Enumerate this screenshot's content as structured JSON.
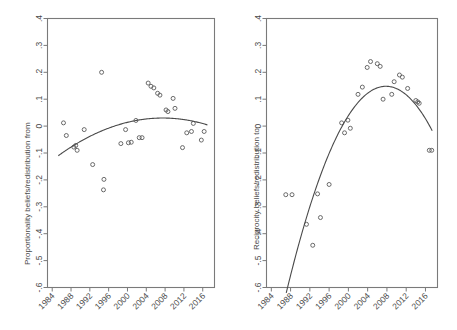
{
  "figure": {
    "type": "multi-panel-scatter",
    "panels": 2,
    "background": "#ffffff",
    "point_color": "#5a5a5a",
    "line_color": "#4a4a4a",
    "axis_color": "#7a7a7a"
  },
  "chart_data": [
    {
      "type": "scatter",
      "panel": "left",
      "title": "",
      "xlabel": "",
      "ylabel": "Proportionality beliefs/redistribution from",
      "xlim": [
        1983,
        2018.5
      ],
      "ylim": [
        -0.6,
        0.4
      ],
      "grid": false,
      "legend": "none",
      "xticks": [
        1984,
        1988,
        1992,
        1996,
        2000,
        2004,
        2008,
        2012,
        2016
      ],
      "xticklabels": [
        "1984",
        "1988",
        "1992",
        "1996",
        "2000",
        "2004",
        "2008",
        "2012",
        "2016"
      ],
      "yticks": [
        0.4,
        0.3,
        0.2,
        0.1,
        0,
        -0.1,
        -0.2,
        -0.3,
        -0.4,
        -0.5,
        -0.6
      ],
      "yticklabels": [
        ".4",
        ".3",
        ".2",
        ".1",
        "0",
        "-.1",
        "-.2",
        "-.3",
        "-.4",
        "-.5",
        "-.6"
      ],
      "points": [
        {
          "x": 1986.4,
          "y": 0.012
        },
        {
          "x": 1987.0,
          "y": -0.035
        },
        {
          "x": 1988.6,
          "y": -0.078
        },
        {
          "x": 1989.0,
          "y": -0.072
        },
        {
          "x": 1989.3,
          "y": -0.09
        },
        {
          "x": 1990.8,
          "y": -0.013
        },
        {
          "x": 1992.6,
          "y": -0.143
        },
        {
          "x": 1994.5,
          "y": 0.2
        },
        {
          "x": 1995.0,
          "y": -0.198
        },
        {
          "x": 1994.9,
          "y": -0.237
        },
        {
          "x": 1998.6,
          "y": -0.065
        },
        {
          "x": 1999.6,
          "y": -0.013
        },
        {
          "x": 2000.2,
          "y": -0.062
        },
        {
          "x": 2000.8,
          "y": -0.06
        },
        {
          "x": 2001.8,
          "y": 0.021
        },
        {
          "x": 2002.5,
          "y": -0.043
        },
        {
          "x": 2003.1,
          "y": -0.043
        },
        {
          "x": 2004.4,
          "y": 0.16
        },
        {
          "x": 2005.0,
          "y": 0.148
        },
        {
          "x": 2005.6,
          "y": 0.142
        },
        {
          "x": 2006.4,
          "y": 0.122
        },
        {
          "x": 2006.9,
          "y": 0.115
        },
        {
          "x": 2008.2,
          "y": 0.06
        },
        {
          "x": 2008.6,
          "y": 0.054
        },
        {
          "x": 2009.7,
          "y": 0.103
        },
        {
          "x": 2010.1,
          "y": 0.066
        },
        {
          "x": 2011.7,
          "y": -0.08
        },
        {
          "x": 2012.6,
          "y": -0.025
        },
        {
          "x": 2013.6,
          "y": -0.02
        },
        {
          "x": 2014.0,
          "y": 0.01
        },
        {
          "x": 2015.7,
          "y": -0.052
        },
        {
          "x": 2016.3,
          "y": -0.02
        }
      ],
      "fit": {
        "kind": "quadratic",
        "description": "concave fitted curve peaking near 2008 at about .03",
        "x_start": 1985.3,
        "x_end": 2017.0,
        "coefficients_note": "vertex (2007.5, 0.030), value at 1985.3 about -0.110, value at 2017.0 about -0.005"
      }
    },
    {
      "type": "scatter",
      "panel": "right",
      "title": "",
      "xlabel": "",
      "ylabel": "Reciprocity beliefs/redistribution to",
      "xlim": [
        1983,
        2018.5
      ],
      "ylim": [
        -0.6,
        0.4
      ],
      "grid": false,
      "legend": "none",
      "xticks": [
        1984,
        1988,
        1992,
        1996,
        2000,
        2004,
        2008,
        2012,
        2016
      ],
      "xticklabels": [
        "1984",
        "1988",
        "1992",
        "1996",
        "2000",
        "2004",
        "2008",
        "2012",
        "2016"
      ],
      "yticks": [
        0.4,
        0.3,
        0.2,
        0.1,
        0,
        -0.1,
        -0.2,
        -0.3,
        -0.4,
        -0.5,
        -0.6
      ],
      "yticklabels": [
        ".4",
        ".3",
        ".2",
        ".1",
        "0",
        "-.1",
        "-.2",
        "-.3",
        "-.4",
        "-.5",
        "-.6"
      ],
      "points": [
        {
          "x": 1987.0,
          "y": -0.255
        },
        {
          "x": 1988.3,
          "y": -0.255
        },
        {
          "x": 1991.3,
          "y": -0.365
        },
        {
          "x": 1992.6,
          "y": -0.443
        },
        {
          "x": 1993.6,
          "y": -0.252
        },
        {
          "x": 1994.2,
          "y": -0.34
        },
        {
          "x": 1996.0,
          "y": -0.217
        },
        {
          "x": 1998.6,
          "y": 0.012
        },
        {
          "x": 1999.2,
          "y": -0.025
        },
        {
          "x": 1999.9,
          "y": 0.022
        },
        {
          "x": 2000.4,
          "y": -0.008
        },
        {
          "x": 2002.0,
          "y": 0.118
        },
        {
          "x": 2002.9,
          "y": 0.145
        },
        {
          "x": 2003.9,
          "y": 0.218
        },
        {
          "x": 2004.6,
          "y": 0.24
        },
        {
          "x": 2006.0,
          "y": 0.232
        },
        {
          "x": 2006.6,
          "y": 0.222
        },
        {
          "x": 2007.2,
          "y": 0.1
        },
        {
          "x": 2009.0,
          "y": 0.118
        },
        {
          "x": 2009.5,
          "y": 0.165
        },
        {
          "x": 2010.6,
          "y": 0.19
        },
        {
          "x": 2011.2,
          "y": 0.182
        },
        {
          "x": 2012.3,
          "y": 0.14
        },
        {
          "x": 2014.0,
          "y": 0.095
        },
        {
          "x": 2014.4,
          "y": 0.09
        },
        {
          "x": 2014.7,
          "y": 0.085
        },
        {
          "x": 2016.8,
          "y": -0.09
        },
        {
          "x": 2017.3,
          "y": -0.09
        }
      ],
      "fit": {
        "kind": "quadratic",
        "description": "concave fitted curve rising steeply from below -.6 near 1987 and peaking near 2008 at about .148",
        "x_start": 1987.1,
        "x_end": 2017.4,
        "coefficients_note": "vertex (2007.8, 0.148), value at 1987.1 about -0.62, value at 2017.4 about 0.01"
      }
    }
  ]
}
